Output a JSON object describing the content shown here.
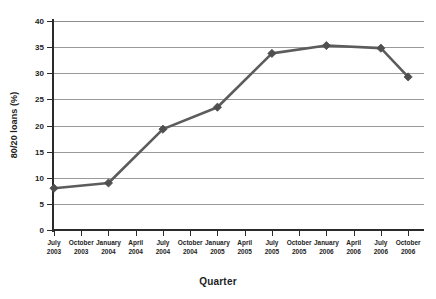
{
  "chart_data": {
    "type": "line",
    "title": "",
    "xlabel": "Quarter",
    "ylabel": "80/20 loans (%)",
    "ylim": [
      0,
      40
    ],
    "yticks": [
      0,
      5,
      10,
      15,
      20,
      25,
      30,
      35,
      40
    ],
    "ytick_labels": [
      "0",
      "5",
      "10",
      "15",
      "20",
      "25",
      "30",
      "35",
      "40"
    ],
    "grid": true,
    "legend": false,
    "legend_position": "none",
    "categories": [
      "July 2003",
      "October 2003",
      "January 2004",
      "April 2004",
      "July 2004",
      "October 2004",
      "January 2005",
      "April 2005",
      "July 2005",
      "October 2005",
      "January 2006",
      "April 2006",
      "July 2006",
      "October 2006"
    ],
    "xtick_labels": [
      {
        "line1": "July",
        "line2": "2003"
      },
      {
        "line1": "October",
        "line2": "2003"
      },
      {
        "line1": "January",
        "line2": "2004"
      },
      {
        "line1": "April",
        "line2": "2004"
      },
      {
        "line1": "July",
        "line2": "2004"
      },
      {
        "line1": "October",
        "line2": "2004"
      },
      {
        "line1": "January",
        "line2": "2005"
      },
      {
        "line1": "April",
        "line2": "2005"
      },
      {
        "line1": "July",
        "line2": "2005"
      },
      {
        "line1": "October",
        "line2": "2005"
      },
      {
        "line1": "January",
        "line2": "2006"
      },
      {
        "line1": "April",
        "line2": "2006"
      },
      {
        "line1": "July",
        "line2": "2006"
      },
      {
        "line1": "October",
        "line2": "2006"
      }
    ],
    "series": [
      {
        "name": "80/20 loans (%)",
        "color": "#5c5c5c",
        "marker": "diamond",
        "points": [
          {
            "category": "July 2003",
            "category_index": 0,
            "value": 8.0
          },
          {
            "category": "January 2004",
            "category_index": 2,
            "value": 9.0
          },
          {
            "category": "July 2004",
            "category_index": 4,
            "value": 19.3
          },
          {
            "category": "January 2005",
            "category_index": 6,
            "value": 23.5
          },
          {
            "category": "July 2005",
            "category_index": 8,
            "value": 33.8
          },
          {
            "category": "January 2006",
            "category_index": 10,
            "value": 35.3
          },
          {
            "category": "July 2006",
            "category_index": 12,
            "value": 34.8
          },
          {
            "category": "October 2006",
            "category_index": 13,
            "value": 29.3
          }
        ]
      }
    ]
  },
  "style": {
    "line_color": "#5c5c5c",
    "marker_color": "#4f4f4f",
    "grid_color": "#9a9a9a",
    "axis_color": "#2b2b2b",
    "text_color": "#1d1d1d",
    "background": "#ffffff"
  }
}
